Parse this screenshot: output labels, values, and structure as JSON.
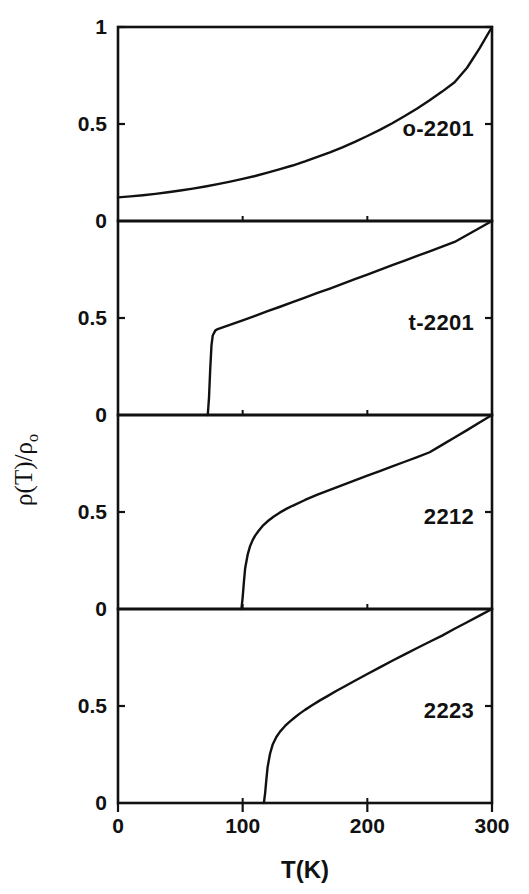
{
  "figure": {
    "axis_title_x": "T(K)",
    "axis_label_y_main": "ρ(T)/ρ",
    "axis_label_y_sub": "o"
  },
  "chart_data": {
    "type": "line",
    "title": "",
    "xlabel": "T(K)",
    "ylabel": "ρ(T)/ρ₀",
    "xlim": [
      0,
      300
    ],
    "ylim": [
      0,
      1
    ],
    "xticks": [
      0,
      100,
      200,
      300
    ],
    "xticklabels": [
      "0",
      "100",
      "200",
      "300"
    ],
    "yticks": [
      0,
      0.5,
      1
    ],
    "grid": false,
    "legend": "none",
    "panel_layout": "stacked-4-shared-x",
    "panels": [
      {
        "label": "o-2201",
        "yticklabels": [
          "0",
          "0.5",
          "1"
        ],
        "yticks": [
          0,
          0.5,
          1
        ],
        "transition_temperature_K": null,
        "x": [
          0,
          10,
          20,
          30,
          40,
          50,
          60,
          70,
          80,
          90,
          100,
          110,
          120,
          130,
          140,
          150,
          160,
          170,
          180,
          190,
          200,
          210,
          220,
          230,
          240,
          250,
          260,
          270,
          280,
          290,
          300
        ],
        "y": [
          0.122,
          0.127,
          0.133,
          0.14,
          0.148,
          0.157,
          0.167,
          0.178,
          0.19,
          0.203,
          0.217,
          0.232,
          0.249,
          0.267,
          0.286,
          0.307,
          0.33,
          0.354,
          0.38,
          0.408,
          0.438,
          0.47,
          0.504,
          0.541,
          0.58,
          0.622,
          0.667,
          0.715,
          0.79,
          0.89,
          1.0
        ]
      },
      {
        "label": "t-2201",
        "yticklabels": [
          "0",
          "0.5"
        ],
        "yticks": [
          0,
          0.5
        ],
        "transition_temperature_K": 75,
        "x": [
          72,
          73,
          74,
          75,
          76,
          78,
          80,
          84,
          88,
          92,
          96,
          100,
          110,
          120,
          130,
          140,
          150,
          160,
          170,
          180,
          190,
          200,
          210,
          220,
          230,
          240,
          250,
          260,
          270,
          280,
          290,
          300
        ],
        "y": [
          0.0,
          0.09,
          0.24,
          0.36,
          0.41,
          0.435,
          0.443,
          0.452,
          0.461,
          0.47,
          0.479,
          0.488,
          0.511,
          0.535,
          0.558,
          0.582,
          0.605,
          0.629,
          0.652,
          0.676,
          0.7,
          0.724,
          0.748,
          0.772,
          0.796,
          0.82,
          0.844,
          0.868,
          0.892,
          0.928,
          0.964,
          1.0
        ]
      },
      {
        "label": "2212",
        "yticklabels": [
          "0",
          "0.5"
        ],
        "yticks": [
          0,
          0.5
        ],
        "transition_temperature_K": 100,
        "x": [
          99,
          100,
          101,
          102,
          104,
          106,
          108,
          110,
          113,
          116,
          120,
          125,
          130,
          135,
          140,
          150,
          160,
          170,
          180,
          190,
          200,
          210,
          220,
          230,
          240,
          250,
          260,
          270,
          280,
          290,
          300
        ],
        "y": [
          0.0,
          0.06,
          0.14,
          0.21,
          0.28,
          0.325,
          0.355,
          0.378,
          0.405,
          0.428,
          0.452,
          0.477,
          0.498,
          0.516,
          0.532,
          0.562,
          0.589,
          0.614,
          0.639,
          0.663,
          0.687,
          0.711,
          0.735,
          0.759,
          0.783,
          0.808,
          0.846,
          0.884,
          0.922,
          0.961,
          1.0
        ]
      },
      {
        "label": "2223",
        "yticklabels": [
          "0",
          "0.5"
        ],
        "yticks": [
          0,
          0.5
        ],
        "transition_temperature_K": 118,
        "x": [
          117,
          118,
          119,
          120,
          122,
          124,
          127,
          130,
          134,
          138,
          142,
          146,
          150,
          156,
          162,
          168,
          175,
          182,
          190,
          200,
          210,
          220,
          230,
          240,
          250,
          260,
          270,
          280,
          290,
          300
        ],
        "y": [
          0.0,
          0.05,
          0.12,
          0.185,
          0.255,
          0.3,
          0.34,
          0.368,
          0.397,
          0.421,
          0.442,
          0.462,
          0.48,
          0.505,
          0.529,
          0.551,
          0.577,
          0.602,
          0.63,
          0.665,
          0.699,
          0.733,
          0.766,
          0.799,
          0.831,
          0.863,
          0.898,
          0.932,
          0.966,
          1.0
        ]
      }
    ]
  }
}
